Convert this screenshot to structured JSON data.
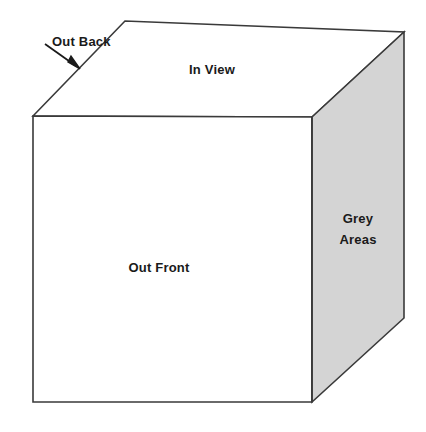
{
  "diagram": {
    "type": "cube",
    "background_color": "#ffffff",
    "stroke_color": "#3a3a3a",
    "text_color": "#1a1a1a",
    "faces": [
      {
        "id": "top",
        "name": "top-face",
        "label": "In View",
        "fill": "#ffffff",
        "points": "33,116 125,21 404,32 312,117",
        "label_x": 212,
        "label_y": 70
      },
      {
        "id": "front",
        "name": "front-face",
        "label": "Out Front",
        "fill": "#ffffff",
        "points": "33,116 312,117 312,402 33,402",
        "label_x": 159,
        "label_y": 268
      },
      {
        "id": "right",
        "name": "right-face",
        "label": "Grey\nAreas",
        "fill": "#d4d4d4",
        "points": "312,117 404,32 404,318 312,402",
        "label_x": 358,
        "label_y": 229
      }
    ],
    "annotation": {
      "label": "Out Back",
      "label_x": 52,
      "label_y": 31,
      "arrow": {
        "name": "out-back-arrow",
        "start_x": 45,
        "start_y": 44,
        "end_x": 80,
        "end_y": 69,
        "head_points": "80,69 68,62 71,56"
      }
    },
    "vertices": {
      "front_top_left": [
        33,
        116
      ],
      "front_top_right": [
        312,
        117
      ],
      "front_bottom_left": [
        33,
        402
      ],
      "front_bottom_right": [
        312,
        402
      ],
      "back_top_left": [
        125,
        21
      ],
      "back_top_right": [
        404,
        32
      ],
      "back_bottom_right": [
        404,
        318
      ]
    }
  }
}
